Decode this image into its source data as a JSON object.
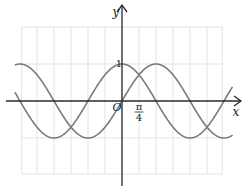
{
  "chart_data": {
    "type": "line",
    "title": "",
    "xlabel": "x",
    "ylabel": "y",
    "origin_label": "O",
    "x_unit": "pi/4",
    "xlim_units_of_pi_over_4": [
      -6.3,
      6.5
    ],
    "grid_x_range_units_of_pi_over_4": [
      -5.9,
      5.9
    ],
    "ylim": [
      -2,
      2
    ],
    "grid": true,
    "y_tick_labels": [
      {
        "value": 1,
        "label": "1"
      }
    ],
    "x_tick_labels": [
      {
        "value_pi_over_4": 1,
        "numerator": "π",
        "denominator": "4"
      }
    ],
    "series": [
      {
        "name": "sin(x)",
        "function": "sin",
        "color": "#7a7a7a"
      },
      {
        "name": "cos(x)",
        "function": "cos",
        "color": "#7a7a7a"
      }
    ]
  },
  "colors": {
    "axis": "#2a2a2a",
    "grid": "#dcdcdc"
  }
}
